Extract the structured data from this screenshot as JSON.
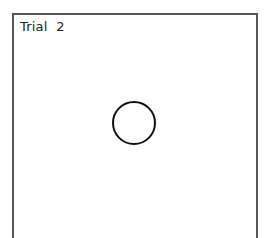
{
  "panel": {
    "trial_label": "Trial  2"
  },
  "target": {
    "shape": "circle-icon",
    "stroke_color": "#111111"
  },
  "colors": {
    "background": "#ffffff",
    "border": "#555555"
  }
}
